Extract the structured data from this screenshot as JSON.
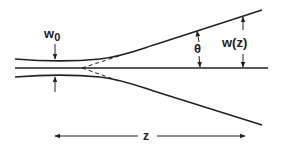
{
  "diagram": {
    "labels": {
      "waist": "w",
      "waist_subscript": "0",
      "angle": "θ",
      "width": "w(z)",
      "distance": "z"
    },
    "colors": {
      "line": "#222222",
      "background": "#ffffff"
    }
  }
}
